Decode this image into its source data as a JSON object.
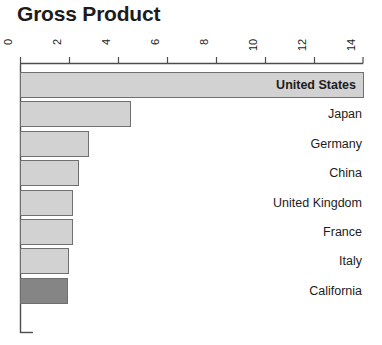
{
  "chart_data": {
    "type": "bar",
    "orientation": "horizontal",
    "title": "Gross Product",
    "xlabel": "",
    "ylabel": "",
    "xlim": [
      0,
      14
    ],
    "xticks": [
      0,
      2,
      4,
      6,
      8,
      10,
      12,
      14
    ],
    "xtick_labels": [
      "0",
      "2",
      "4",
      "6",
      "8",
      "10",
      "12",
      "14"
    ],
    "grid": false,
    "legend": "none",
    "categories": [
      "United States",
      "Japan",
      "Germany",
      "China",
      "United Kingdom",
      "France",
      "Italy",
      "California"
    ],
    "values": [
      14.0,
      4.5,
      2.8,
      2.4,
      2.15,
      2.15,
      2.0,
      1.95
    ],
    "bars": [
      {
        "label": "United States",
        "value": 14.0,
        "highlight": false,
        "label_inside": true
      },
      {
        "label": "Japan",
        "value": 4.5,
        "highlight": false,
        "label_inside": false
      },
      {
        "label": "Germany",
        "value": 2.8,
        "highlight": false,
        "label_inside": false
      },
      {
        "label": "China",
        "value": 2.4,
        "highlight": false,
        "label_inside": false
      },
      {
        "label": "United Kingdom",
        "value": 2.15,
        "highlight": false,
        "label_inside": false
      },
      {
        "label": "France",
        "value": 2.15,
        "highlight": false,
        "label_inside": false
      },
      {
        "label": "Italy",
        "value": 2.0,
        "highlight": false,
        "label_inside": false
      },
      {
        "label": "California",
        "value": 1.95,
        "highlight": true,
        "label_inside": false
      }
    ],
    "colors": {
      "bar_fill": "#d2d2d2",
      "bar_highlight_fill": "#858585",
      "bar_stroke": "#6f6f6f",
      "axis": "#4d4d4d",
      "text": "#1c1c1c",
      "background": "#ffffff"
    }
  }
}
